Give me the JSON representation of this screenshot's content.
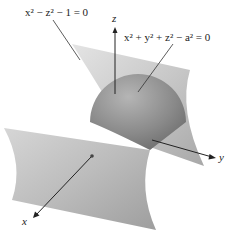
{
  "figure": {
    "equations": {
      "hyperbolic_cylinder": "x² − z² − 1 = 0",
      "sphere": "x² + y² + z² − a² = 0"
    },
    "axes": {
      "x": "x",
      "y": "y",
      "z": "z"
    }
  }
}
